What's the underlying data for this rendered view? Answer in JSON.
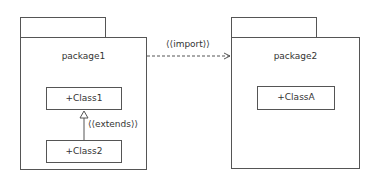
{
  "diagram": {
    "type": "uml-package-diagram",
    "packages": [
      {
        "name": "package1",
        "classes": [
          "+Class1",
          "+Class2"
        ]
      },
      {
        "name": "package2",
        "classes": [
          "+ClassA"
        ]
      }
    ],
    "relations": [
      {
        "type": "import",
        "label": "⟨⟨import⟩⟩",
        "from": "package1",
        "to": "package2",
        "style": "dashed-open-arrow"
      },
      {
        "type": "extends",
        "label": "⟨⟨extends⟩⟩",
        "from": "+Class2",
        "to": "+Class1",
        "style": "solid-hollow-triangle"
      }
    ]
  },
  "package1": {
    "name": "package1",
    "class1": "+Class1",
    "class2": "+Class2"
  },
  "package2": {
    "name": "package2",
    "classA": "+ClassA"
  },
  "import_label": "⟨⟨import⟩⟩",
  "extends_label": "⟨⟨extends⟩⟩",
  "colors": {
    "line": "#555555",
    "text": "#333333",
    "background": "#ffffff"
  }
}
